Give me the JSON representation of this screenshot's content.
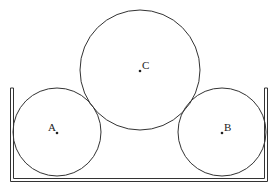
{
  "diagram": {
    "type": "physics-cylinders-in-container",
    "stroke_color": "#333333",
    "background": "#ffffff",
    "container": {
      "left_outer_x": 10,
      "left_inner_x": 13,
      "right_inner_x": 264,
      "right_outer_x": 267,
      "top_y": 88,
      "bottom_inner_y": 178,
      "bottom_outer_y": 181
    },
    "circles": [
      {
        "id": "A",
        "label": "A",
        "cx": 57,
        "cy": 132,
        "r": 44,
        "label_x": 48,
        "label_y": 131
      },
      {
        "id": "B",
        "label": "B",
        "cx": 222,
        "cy": 132,
        "r": 44,
        "label_x": 224,
        "label_y": 131
      },
      {
        "id": "C",
        "label": "C",
        "cx": 140,
        "cy": 70,
        "r": 60,
        "label_x": 142,
        "label_y": 69
      }
    ]
  }
}
